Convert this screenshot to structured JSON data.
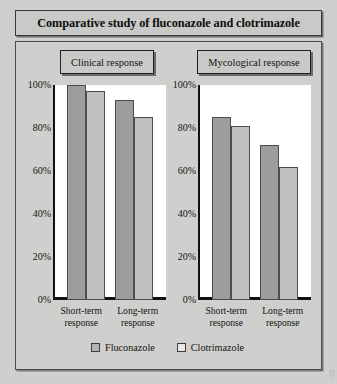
{
  "title": "Comparative study of fluconazole and clotrimazole",
  "panels": [
    {
      "key": "clinical",
      "header": "Clinical response"
    },
    {
      "key": "mycological",
      "header": "Mycological response"
    }
  ],
  "legend": {
    "items": [
      {
        "label": "Fluconazole",
        "color": "#9d9d9d"
      },
      {
        "label": "Clotrimazole",
        "color": "#c0c0c0"
      }
    ]
  },
  "axis": {
    "ticks": [
      "100%",
      "80%",
      "60%",
      "40%",
      "20%",
      "0%"
    ],
    "categories": [
      "Short-term response",
      "Long-term response"
    ],
    "category_lines": [
      [
        "Short-term",
        "response"
      ],
      [
        "Long-term",
        "response"
      ]
    ]
  },
  "chart_data": [
    {
      "type": "bar",
      "title": "Clinical response",
      "categories": [
        "Short-term response",
        "Long-term response"
      ],
      "series": [
        {
          "name": "Fluconazole",
          "values": [
            100,
            93
          ]
        },
        {
          "name": "Clotrimazole",
          "values": [
            97,
            85
          ]
        }
      ],
      "xlabel": "",
      "ylabel": "",
      "ylim": [
        0,
        100
      ],
      "yticks": [
        0,
        20,
        40,
        60,
        80,
        100
      ],
      "ytick_labels": [
        "0%",
        "20%",
        "40%",
        "60%",
        "80%",
        "100%"
      ],
      "grid": false,
      "legend_position": "bottom"
    },
    {
      "type": "bar",
      "title": "Mycological response",
      "categories": [
        "Short-term response",
        "Long-term response"
      ],
      "series": [
        {
          "name": "Fluconazole",
          "values": [
            85,
            72
          ]
        },
        {
          "name": "Clotrimazole",
          "values": [
            81,
            62
          ]
        }
      ],
      "xlabel": "",
      "ylabel": "",
      "ylim": [
        0,
        100
      ],
      "yticks": [
        0,
        20,
        40,
        60,
        80,
        100
      ],
      "ytick_labels": [
        "0%",
        "20%",
        "40%",
        "60%",
        "80%",
        "100%"
      ],
      "grid": false,
      "legend_position": "bottom"
    }
  ]
}
